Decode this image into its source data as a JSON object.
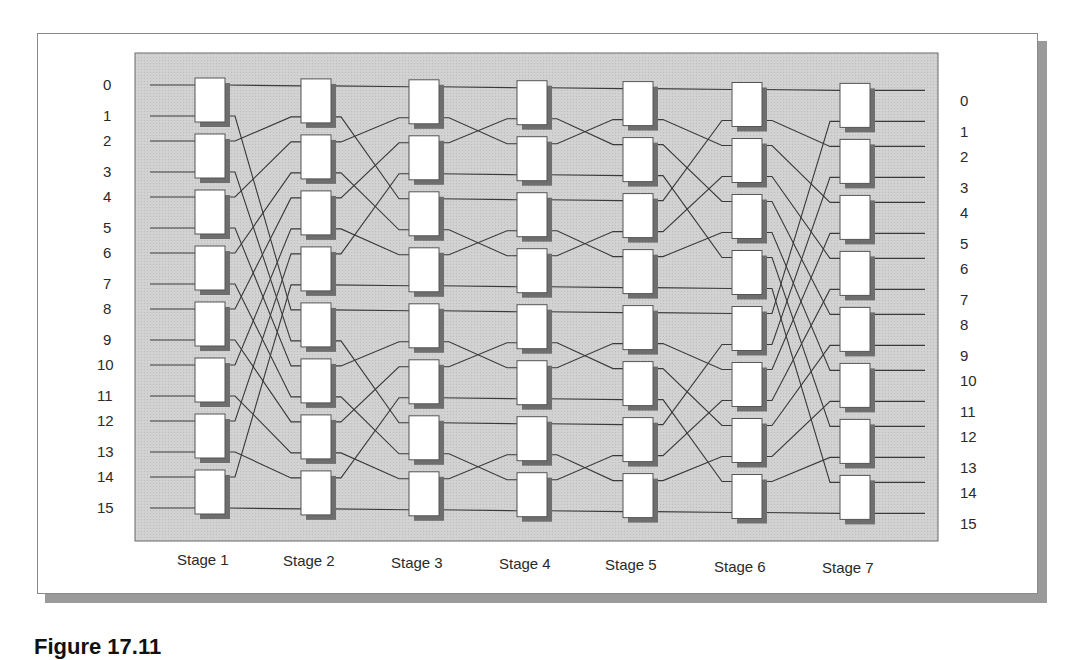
{
  "figure": {
    "type": "benes-network",
    "ports": 16,
    "stages": 7,
    "input_labels": [
      "0",
      "1",
      "2",
      "3",
      "4",
      "5",
      "6",
      "7",
      "8",
      "9",
      "10",
      "11",
      "12",
      "13",
      "14",
      "15"
    ],
    "output_labels": [
      "0",
      "1",
      "2",
      "3",
      "4",
      "5",
      "6",
      "7",
      "8",
      "9",
      "10",
      "11",
      "12",
      "13",
      "14",
      "15"
    ],
    "stage_labels": [
      "Stage 1",
      "Stage 2",
      "Stage 3",
      "Stage 4",
      "Stage 5",
      "Stage 6",
      "Stage 7"
    ],
    "caption": "Figure 17.11",
    "colors": {
      "panel": "#cfcfcf",
      "panel_border": "#6a6a6a",
      "switch_fill": "#ffffff",
      "switch_border": "#555555",
      "switch_shadow": "#6e6e6e",
      "wire": "#3a3a3a"
    }
  }
}
